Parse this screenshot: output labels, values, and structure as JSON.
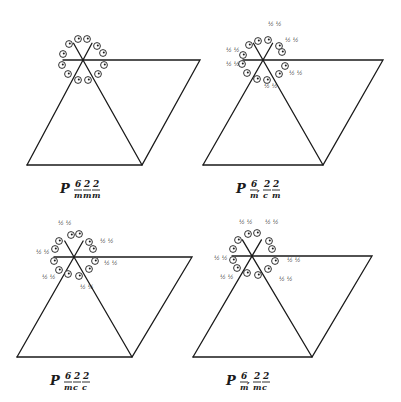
{
  "figure": {
    "colors": {
      "ink": "#1a1a1a",
      "background": "#ffffff"
    }
  },
  "panels": [
    {
      "id": "P6/mmm",
      "label": {
        "prefix": "P",
        "numerators": [
          "6",
          "2",
          "2"
        ],
        "denominators": [
          "m",
          "m",
          "m"
        ],
        "screw": ""
      },
      "center": [
        83,
        60
      ],
      "cell": {
        "top_right": [
          200,
          60
        ],
        "bottom_left": [
          27,
          165
        ],
        "bottom_right": [
          142,
          165
        ]
      },
      "points": [
        {
          "x": 69,
          "y": 44,
          "frac": ""
        },
        {
          "x": 78,
          "y": 39,
          "frac": ""
        },
        {
          "x": 87,
          "y": 39,
          "frac": ""
        },
        {
          "x": 97,
          "y": 46,
          "frac": ""
        },
        {
          "x": 103,
          "y": 53,
          "frac": ""
        },
        {
          "x": 104,
          "y": 65,
          "frac": ""
        },
        {
          "x": 98,
          "y": 74,
          "frac": ""
        },
        {
          "x": 88,
          "y": 80,
          "frac": ""
        },
        {
          "x": 78,
          "y": 80,
          "frac": ""
        },
        {
          "x": 68,
          "y": 74,
          "frac": ""
        },
        {
          "x": 62,
          "y": 65,
          "frac": ""
        },
        {
          "x": 63,
          "y": 54,
          "frac": ""
        }
      ]
    },
    {
      "id": "P6_3/mcm",
      "label": {
        "prefix": "P",
        "numerators": [
          "6",
          "2",
          "2"
        ],
        "denominators": [
          "m",
          "c",
          "m"
        ],
        "screw": "3"
      },
      "center": [
        263,
        60
      ],
      "cell": {
        "top_right": [
          383,
          60
        ],
        "bottom_left": [
          203,
          165
        ],
        "bottom_right": [
          323,
          165
        ]
      },
      "points": [
        {
          "x": 249,
          "y": 45,
          "frac": ""
        },
        {
          "x": 258,
          "y": 41,
          "frac": "½ ½"
        },
        {
          "x": 268,
          "y": 40,
          "frac": ""
        },
        {
          "x": 279,
          "y": 46,
          "frac": "½ ½"
        },
        {
          "x": 282,
          "y": 52,
          "frac": ""
        },
        {
          "x": 285,
          "y": 66,
          "frac": ""
        },
        {
          "x": 279,
          "y": 74,
          "frac": "½ ½"
        },
        {
          "x": 267,
          "y": 80,
          "frac": "½ ½"
        },
        {
          "x": 257,
          "y": 79,
          "frac": ""
        },
        {
          "x": 247,
          "y": 73,
          "frac": ""
        },
        {
          "x": 242,
          "y": 64,
          "frac": "½ ½"
        },
        {
          "x": 243,
          "y": 55,
          "frac": "½ ½"
        }
      ],
      "fraction_labels": [
        {
          "x": 268,
          "y": 26,
          "text": "½ ½"
        },
        {
          "x": 285,
          "y": 42,
          "text": "½ ½"
        },
        {
          "x": 226,
          "y": 52,
          "text": "½ ½"
        },
        {
          "x": 226,
          "y": 66,
          "text": "½ ½"
        },
        {
          "x": 289,
          "y": 75,
          "text": "½ ½"
        },
        {
          "x": 264,
          "y": 88,
          "text": "½ ½"
        }
      ]
    },
    {
      "id": "P6/mcc",
      "label": {
        "prefix": "P",
        "numerators": [
          "6",
          "2",
          "2"
        ],
        "denominators": [
          "m",
          "c",
          "c"
        ],
        "screw": ""
      },
      "center": [
        74,
        257
      ],
      "cell": {
        "top_right": [
          192,
          257
        ],
        "bottom_left": [
          17,
          357
        ],
        "bottom_right": [
          132,
          357
        ]
      },
      "points": [
        {
          "x": 59,
          "y": 241,
          "frac": ""
        },
        {
          "x": 71,
          "y": 235,
          "frac": ""
        },
        {
          "x": 79,
          "y": 234,
          "frac": ""
        },
        {
          "x": 89,
          "y": 242,
          "frac": ""
        },
        {
          "x": 93,
          "y": 249,
          "frac": ""
        },
        {
          "x": 95,
          "y": 261,
          "frac": ""
        },
        {
          "x": 89,
          "y": 269,
          "frac": ""
        },
        {
          "x": 79,
          "y": 276,
          "frac": ""
        },
        {
          "x": 68,
          "y": 274,
          "frac": ""
        },
        {
          "x": 59,
          "y": 270,
          "frac": ""
        },
        {
          "x": 54,
          "y": 261,
          "frac": ""
        },
        {
          "x": 55,
          "y": 249,
          "frac": ""
        }
      ],
      "fraction_labels": [
        {
          "x": 58,
          "y": 225,
          "text": "½ ½"
        },
        {
          "x": 100,
          "y": 243,
          "text": "½ ½"
        },
        {
          "x": 36,
          "y": 254,
          "text": "½ ½"
        },
        {
          "x": 104,
          "y": 265,
          "text": "½ ½"
        },
        {
          "x": 42,
          "y": 279,
          "text": "½ ½"
        },
        {
          "x": 80,
          "y": 289,
          "text": "½ ½"
        }
      ]
    },
    {
      "id": "P6_3/mmc",
      "label": {
        "prefix": "P",
        "numerators": [
          "6",
          "2",
          "2"
        ],
        "denominators": [
          "m",
          "m",
          "c"
        ],
        "screw": "3"
      },
      "center": [
        252,
        256
      ],
      "cell": {
        "top_right": [
          372,
          256
        ],
        "bottom_left": [
          193,
          357
        ],
        "bottom_right": [
          312,
          357
        ]
      },
      "points": [
        {
          "x": 238,
          "y": 240,
          "frac": ""
        },
        {
          "x": 248,
          "y": 234,
          "frac": ""
        },
        {
          "x": 257,
          "y": 233,
          "frac": ""
        },
        {
          "x": 269,
          "y": 241,
          "frac": ""
        },
        {
          "x": 272,
          "y": 249,
          "frac": ""
        },
        {
          "x": 275,
          "y": 261,
          "frac": ""
        },
        {
          "x": 268,
          "y": 269,
          "frac": ""
        },
        {
          "x": 258,
          "y": 275,
          "frac": ""
        },
        {
          "x": 247,
          "y": 273,
          "frac": ""
        },
        {
          "x": 237,
          "y": 268,
          "frac": ""
        },
        {
          "x": 233,
          "y": 260,
          "frac": ""
        },
        {
          "x": 233,
          "y": 249,
          "frac": ""
        }
      ],
      "fraction_labels": [
        {
          "x": 239,
          "y": 224,
          "text": "½ ½"
        },
        {
          "x": 265,
          "y": 224,
          "text": "½ ½"
        },
        {
          "x": 214,
          "y": 260,
          "text": "½ ½"
        },
        {
          "x": 287,
          "y": 262,
          "text": "½ ½"
        },
        {
          "x": 220,
          "y": 279,
          "text": "½ ½"
        },
        {
          "x": 279,
          "y": 281,
          "text": "½ ½"
        }
      ]
    }
  ]
}
